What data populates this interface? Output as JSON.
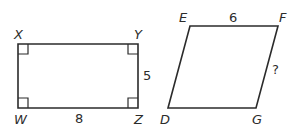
{
  "figures": [
    {
      "type": "rectangle",
      "vertices": {
        "top_left": "X",
        "top_right": "Y",
        "bottom_left": "W",
        "bottom_right": "Z"
      },
      "side_labels": {
        "right": "5",
        "bottom": "8"
      },
      "right_angle_marks": 4
    },
    {
      "type": "parallelogram",
      "vertices": {
        "top_left": "E",
        "top_right": "F",
        "bottom_left": "D",
        "bottom_right": "G"
      },
      "side_labels": {
        "top": "6",
        "right": "?"
      }
    }
  ],
  "colors": {
    "stroke": "#2b2b2b",
    "background": "#ffffff"
  }
}
